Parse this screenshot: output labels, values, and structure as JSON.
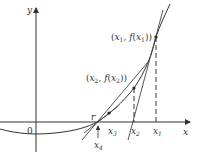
{
  "diagram": {
    "axes": {
      "x_label": "x",
      "y_label": "y",
      "origin_label": "0"
    },
    "points": [
      {
        "id": "x1",
        "label_main": "x",
        "label_sub": "1",
        "coord_label": "(x1, f(x1))"
      },
      {
        "id": "x2",
        "label_main": "x",
        "label_sub": "2",
        "coord_label": "(x2, f(x2))"
      },
      {
        "id": "x3",
        "label_main": "x",
        "label_sub": "3"
      },
      {
        "id": "x4",
        "label_main": "x",
        "label_sub": "4"
      }
    ],
    "root_label": "r",
    "coord_labels": {
      "p1": {
        "open": "(",
        "x": "x",
        "x_sub": "1",
        "comma": ", ",
        "f": "f",
        "paren_open": "(",
        "fx": "x",
        "fx_sub": "1",
        "close": "))"
      },
      "p2": {
        "open": "(",
        "x": "x",
        "x_sub": "2",
        "comma": ", ",
        "f": "f",
        "paren_open": "(",
        "fx": "x",
        "fx_sub": "2",
        "close": "))"
      }
    },
    "colors": {
      "line": "#333333",
      "curve": "#333333",
      "tangent": "#555555"
    }
  }
}
